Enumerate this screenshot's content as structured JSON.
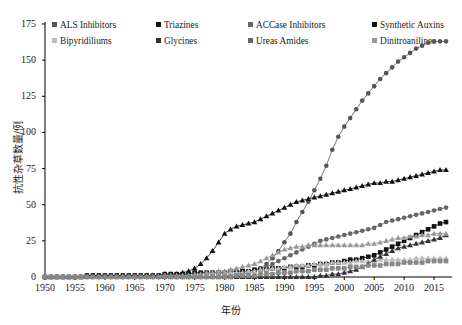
{
  "chart_data": {
    "type": "line",
    "title": "",
    "xlabel": "年份",
    "ylabel": "抗性杂草数量/例",
    "xlim": [
      1950,
      2018
    ],
    "ylim": [
      0,
      175
    ],
    "grid": false,
    "legend_position": "top-left",
    "xticks": [
      1950,
      1955,
      1960,
      1965,
      1970,
      1975,
      1980,
      1985,
      1990,
      1995,
      2000,
      2005,
      2010,
      2015
    ],
    "yticks": [
      0,
      25,
      50,
      75,
      100,
      125,
      150,
      175
    ],
    "x": [
      1950,
      1951,
      1952,
      1953,
      1954,
      1955,
      1956,
      1957,
      1958,
      1959,
      1960,
      1961,
      1962,
      1963,
      1964,
      1965,
      1966,
      1967,
      1968,
      1969,
      1970,
      1971,
      1972,
      1973,
      1974,
      1975,
      1976,
      1977,
      1978,
      1979,
      1980,
      1981,
      1982,
      1983,
      1984,
      1985,
      1986,
      1987,
      1988,
      1989,
      1990,
      1991,
      1992,
      1993,
      1994,
      1995,
      1996,
      1997,
      1998,
      1999,
      2000,
      2001,
      2002,
      2003,
      2004,
      2005,
      2006,
      2007,
      2008,
      2009,
      2010,
      2011,
      2012,
      2013,
      2014,
      2015,
      2016,
      2017
    ],
    "series": [
      {
        "name": "ALS Inhibitors",
        "marker": "circle",
        "color": "#555555",
        "values": [
          0,
          0,
          0,
          0,
          0,
          0,
          0,
          0,
          0,
          0,
          0,
          0,
          0,
          0,
          0,
          0,
          0,
          0,
          0,
          0,
          0,
          0,
          0,
          0,
          0,
          0,
          0,
          0,
          0,
          0,
          0,
          0,
          1,
          2,
          3,
          4,
          6,
          9,
          13,
          18,
          24,
          30,
          38,
          45,
          52,
          60,
          68,
          77,
          88,
          97,
          104,
          110,
          116,
          122,
          127,
          132,
          137,
          141,
          145,
          149,
          152,
          155,
          158,
          160,
          162,
          163,
          163,
          163
        ]
      },
      {
        "name": "Triazines",
        "marker": "triangle",
        "color": "#111111",
        "values": [
          0,
          0,
          0,
          0,
          0,
          0,
          0,
          1,
          1,
          1,
          1,
          1,
          1,
          1,
          1,
          1,
          1,
          1,
          1,
          1,
          2,
          2,
          2,
          3,
          4,
          6,
          9,
          13,
          18,
          24,
          30,
          33,
          35,
          36,
          37,
          38,
          40,
          42,
          44,
          46,
          48,
          50,
          52,
          53,
          54,
          55,
          56,
          57,
          58,
          59,
          60,
          61,
          62,
          63,
          64,
          65,
          65,
          66,
          66,
          67,
          68,
          69,
          70,
          71,
          72,
          73,
          74,
          74
        ]
      },
      {
        "name": "ACCase Inhibitors",
        "marker": "circle",
        "color": "#666666",
        "values": [
          0,
          0,
          0,
          0,
          0,
          0,
          0,
          0,
          0,
          0,
          0,
          0,
          0,
          0,
          0,
          0,
          0,
          0,
          0,
          0,
          0,
          0,
          0,
          0,
          0,
          0,
          0,
          0,
          0,
          0,
          1,
          1,
          2,
          3,
          4,
          5,
          6,
          7,
          9,
          11,
          13,
          15,
          17,
          19,
          21,
          23,
          25,
          26,
          27,
          28,
          29,
          30,
          31,
          32,
          33,
          34,
          36,
          38,
          39,
          40,
          41,
          42,
          43,
          44,
          45,
          46,
          47,
          48
        ]
      },
      {
        "name": "Synthetic Auxins",
        "marker": "square",
        "color": "#111111",
        "values": [
          0,
          0,
          0,
          0,
          0,
          0,
          0,
          1,
          1,
          1,
          1,
          1,
          1,
          1,
          1,
          1,
          1,
          1,
          1,
          1,
          2,
          2,
          2,
          2,
          2,
          3,
          3,
          3,
          3,
          3,
          3,
          4,
          4,
          4,
          4,
          5,
          5,
          5,
          6,
          6,
          6,
          7,
          7,
          7,
          8,
          8,
          9,
          9,
          10,
          10,
          11,
          12,
          12,
          13,
          14,
          15,
          17,
          19,
          21,
          23,
          25,
          27,
          29,
          31,
          33,
          35,
          37,
          38
        ]
      },
      {
        "name": "Bipyridiliums",
        "marker": "triangle",
        "color": "#bbbbbb",
        "values": [
          0,
          0,
          0,
          0,
          0,
          0,
          0,
          0,
          0,
          0,
          0,
          0,
          0,
          0,
          0,
          0,
          0,
          0,
          0,
          0,
          1,
          1,
          1,
          1,
          1,
          1,
          1,
          2,
          2,
          2,
          2,
          3,
          3,
          3,
          4,
          4,
          5,
          5,
          6,
          6,
          7,
          7,
          8,
          8,
          8,
          9,
          9,
          9,
          10,
          10,
          10,
          10,
          11,
          11,
          11,
          11,
          12,
          12,
          12,
          12,
          12,
          12,
          13,
          13,
          13,
          13,
          13,
          13
        ]
      },
      {
        "name": "Glycines",
        "marker": "triangle",
        "color": "#333333",
        "values": [
          0,
          0,
          0,
          0,
          0,
          0,
          0,
          0,
          0,
          0,
          0,
          0,
          0,
          0,
          0,
          0,
          0,
          0,
          0,
          0,
          0,
          0,
          0,
          0,
          0,
          0,
          0,
          0,
          0,
          0,
          0,
          0,
          0,
          0,
          0,
          0,
          0,
          0,
          0,
          0,
          0,
          0,
          0,
          0,
          0,
          0,
          1,
          1,
          2,
          2,
          3,
          4,
          5,
          7,
          9,
          12,
          14,
          16,
          18,
          20,
          21,
          22,
          23,
          24,
          25,
          26,
          27,
          29
        ]
      },
      {
        "name": "Ureas Amides",
        "marker": "triangle",
        "color": "#999999",
        "values": [
          0,
          0,
          0,
          0,
          0,
          0,
          0,
          0,
          0,
          0,
          0,
          0,
          0,
          0,
          0,
          0,
          0,
          0,
          0,
          0,
          1,
          1,
          1,
          1,
          1,
          2,
          2,
          3,
          3,
          4,
          4,
          5,
          6,
          7,
          8,
          9,
          11,
          13,
          15,
          17,
          19,
          20,
          21,
          21,
          22,
          22,
          22,
          22,
          22,
          22,
          22,
          22,
          22,
          22,
          23,
          23,
          24,
          25,
          26,
          27,
          27,
          28,
          28,
          29,
          29,
          30,
          30,
          30
        ]
      },
      {
        "name": "Dinitroanilines",
        "marker": "square",
        "color": "#888888",
        "values": [
          0,
          0,
          0,
          0,
          0,
          0,
          0,
          0,
          0,
          0,
          0,
          0,
          0,
          0,
          0,
          0,
          0,
          0,
          0,
          0,
          0,
          0,
          0,
          0,
          0,
          0,
          0,
          0,
          0,
          0,
          0,
          0,
          1,
          1,
          1,
          1,
          2,
          2,
          2,
          3,
          3,
          3,
          4,
          4,
          4,
          5,
          5,
          5,
          6,
          6,
          6,
          7,
          7,
          7,
          8,
          8,
          8,
          9,
          9,
          9,
          10,
          10,
          10,
          10,
          11,
          11,
          11,
          11
        ]
      }
    ]
  },
  "legend": {
    "rows": [
      [
        {
          "label": "ALS Inhibitors",
          "color": "#555555"
        },
        {
          "label": "Triazines",
          "color": "#111111"
        },
        {
          "label": "ACCase Inhibitors",
          "color": "#666666"
        },
        {
          "label": "Synthetic Auxins",
          "color": "#111111"
        }
      ],
      [
        {
          "label": "Bipyridiliums",
          "color": "#bbbbbb"
        },
        {
          "label": "Glycines",
          "color": "#333333"
        },
        {
          "label": "Ureas Amides",
          "color": "#666666"
        },
        {
          "label": "Dinitroanilines",
          "color": "#999999"
        }
      ]
    ]
  }
}
